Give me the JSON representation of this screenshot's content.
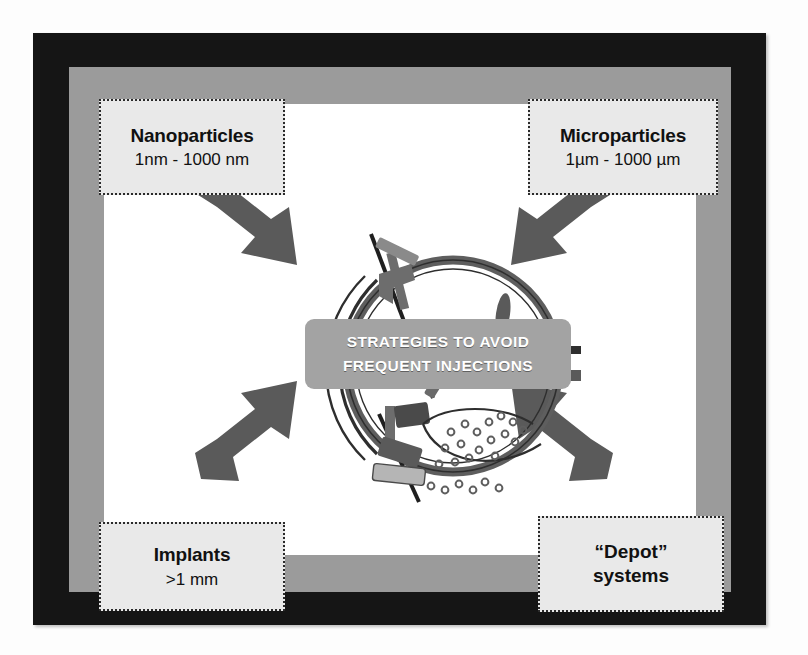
{
  "figure": {
    "type": "conceptual-diagram",
    "center_banner": {
      "line1": "STRATEGIES TO AVOID",
      "line2": "FREQUENT  INJECTIONS",
      "background_color": "#a3a3a3",
      "text_color": "#ffffff"
    },
    "frame": {
      "outer_border_color": "#151515",
      "band_color": "#9b9b9b",
      "content_color": "#ffffff"
    }
  },
  "labels": {
    "nanoparticles": {
      "title": "Nanoparticles",
      "range": "1nm - 1000 nm",
      "position": "top-left"
    },
    "microparticles": {
      "title": "Microparticles",
      "range": "1µm - 1000 µm",
      "position": "top-right"
    },
    "implants": {
      "title": "Implants",
      "range": ">1 mm",
      "position": "bottom-left"
    },
    "depot": {
      "title": "“Depot”",
      "range": "systems",
      "position": "bottom-right"
    }
  },
  "arrows": {
    "count": 4,
    "color": "#5a5a5a",
    "directions": [
      "top-left-to-center",
      "top-right-to-center",
      "bottom-left-to-center",
      "bottom-right-to-center"
    ]
  },
  "eye_diagram": {
    "description": "Cross-section of a human eye with drug delivery devices",
    "elements": [
      "sclera-outline",
      "cornea",
      "lens",
      "optic-nerve",
      "episcleral-implant",
      "intravitreal-implant",
      "injection-needle",
      "microparticle-suspension"
    ],
    "outline_color": "#4a4a4a",
    "particle_color": "#6f6f6f"
  }
}
